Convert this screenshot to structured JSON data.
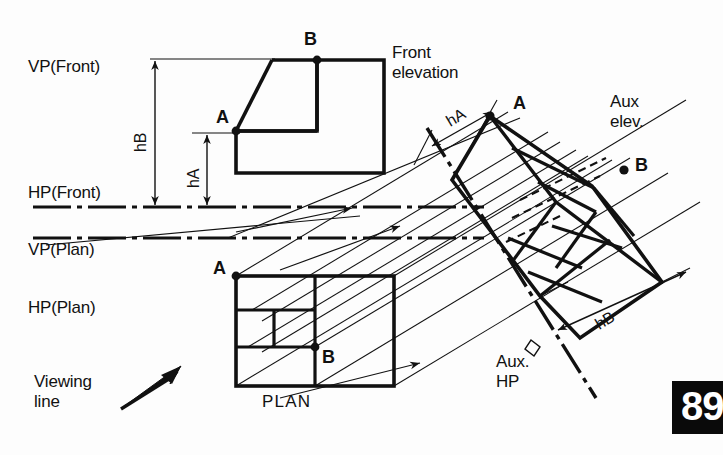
{
  "page": {
    "number": "89",
    "figure_type": "auxiliary-projection-engineering-drawing"
  },
  "planes": {
    "vp_front": "VP(Front)",
    "hp_front": "HP(Front)",
    "vp_plan": "VP(Plan)",
    "hp_plan": "HP(Plan)",
    "aux_hp_line1": "Aux.",
    "aux_hp_line2": "HP"
  },
  "views": {
    "front_elevation_line1": "Front",
    "front_elevation_line2": "elevation",
    "aux_elevation_line1": "Aux",
    "aux_elevation_line2": "elev.",
    "plan_title": "PLAN"
  },
  "viewing": {
    "line1": "Viewing",
    "line2": "line"
  },
  "points": {
    "front_a": "A",
    "front_b": "B",
    "plan_a": "A",
    "plan_b": "B",
    "aux_a": "A",
    "aux_b": "B"
  },
  "dimensions": {
    "hb_front": "hB",
    "ha_front": "hA",
    "ha_aux": "hA",
    "hb_aux": "hB"
  },
  "colors": {
    "ink": "#111111",
    "thin_ink": "#1a1a1a",
    "pagenum_bg": "#0a0a0a",
    "pagenum_fg": "#ffffff",
    "paper": "#fdfdfd"
  }
}
